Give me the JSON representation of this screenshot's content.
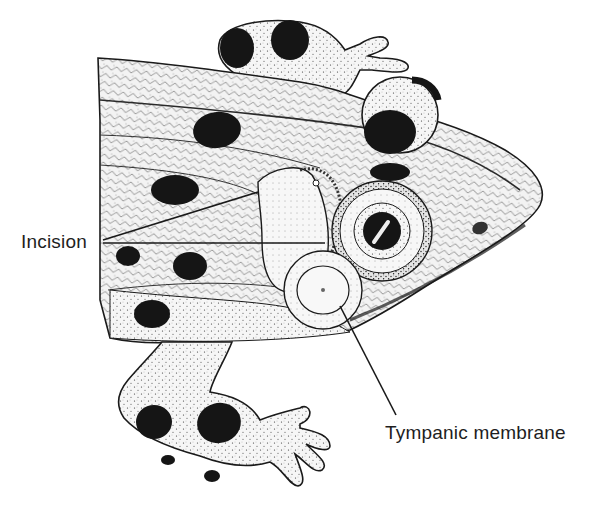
{
  "figure": {
    "style": "stippled pen-and-ink scientific illustration",
    "colors": {
      "background": "#ffffff",
      "ink": "#1a1a1a",
      "skin": "#f4f4f4",
      "spots": "#151515",
      "label_text": "#1e1e1e"
    }
  },
  "labels": {
    "incision": "Incision",
    "tympanic_membrane": "Tympanic membrane"
  }
}
